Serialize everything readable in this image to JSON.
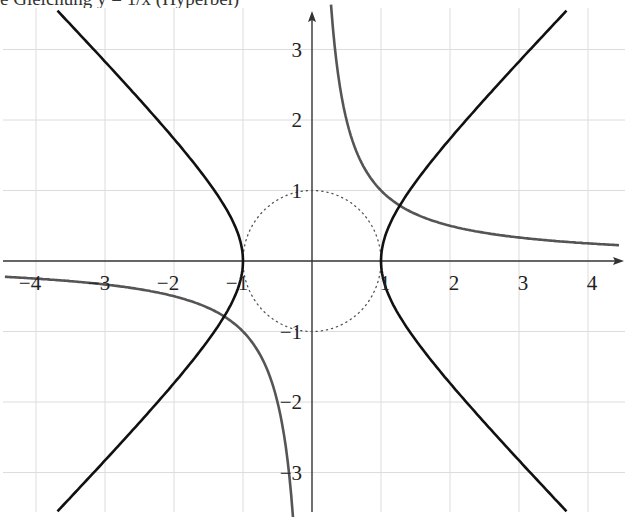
{
  "caption": "e Gleichung y = 1/x (Hyperbel)",
  "chart_data": {
    "type": "line",
    "title": "",
    "xlabel": "",
    "ylabel": "",
    "xlim": [
      -4.5,
      4.5
    ],
    "ylim": [
      -3.5,
      3.5
    ],
    "grid": true,
    "x_ticks": [
      -4,
      -3,
      -2,
      -1,
      1,
      2,
      3,
      4
    ],
    "y_ticks": [
      -3,
      -2,
      -1,
      1,
      2,
      3
    ],
    "x_tick_labels": [
      "−4",
      "−3",
      "−2",
      "−1",
      "1",
      "2",
      "3",
      "4"
    ],
    "y_tick_labels": [
      "−3",
      "−2",
      "−1",
      "1",
      "2",
      "3"
    ],
    "series": [
      {
        "name": "hyperbola x^2 - y^2 = 1",
        "equation": "x^2 - y^2 = 1",
        "color": "#111111",
        "style": "solid",
        "vertices": [
          [
            -1,
            0
          ],
          [
            1,
            0
          ]
        ],
        "sample_points": [
          [
            1,
            0
          ],
          [
            1.41,
            1
          ],
          [
            2.24,
            2
          ],
          [
            3.16,
            3
          ],
          [
            3.65,
            3.5
          ],
          [
            -3.65,
            3.5
          ],
          [
            -1,
            0
          ],
          [
            -3.65,
            -3.5
          ]
        ]
      },
      {
        "name": "y = 1/x",
        "equation": "y = 1/x",
        "color": "#555555",
        "style": "solid",
        "sample_points": [
          [
            0.28,
            3.6
          ],
          [
            0.5,
            2
          ],
          [
            1,
            1
          ],
          [
            2,
            0.5
          ],
          [
            3,
            0.33
          ],
          [
            4.45,
            0.22
          ],
          [
            -4.45,
            -0.22
          ],
          [
            -1,
            -1
          ],
          [
            -0.5,
            -2
          ],
          [
            -0.28,
            -3.6
          ]
        ]
      },
      {
        "name": "unit circle x^2 + y^2 = 1",
        "equation": "x^2 + y^2 = 1",
        "color": "#555555",
        "style": "dotted",
        "center": [
          0,
          0
        ],
        "radius": 1
      }
    ],
    "annotations": [
      {
        "text": "intersection",
        "point": [
          1.27,
          0.79
        ]
      },
      {
        "text": "intersection",
        "point": [
          -1.27,
          -0.79
        ]
      }
    ]
  },
  "layout": {
    "origin_px": [
      312,
      261
    ],
    "unit_x_px": 69,
    "unit_y_px": 70.5,
    "grid_color": "#dcdcdc",
    "axis_color": "#333333"
  }
}
